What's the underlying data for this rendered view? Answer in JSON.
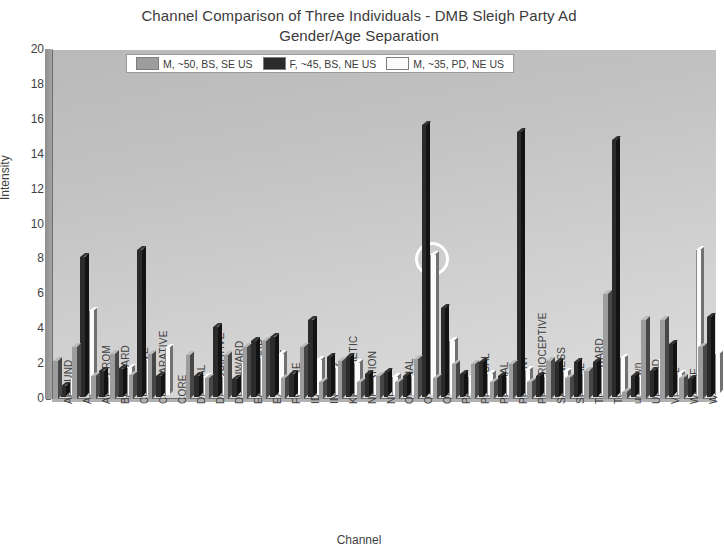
{
  "chart": {
    "title_line1": "Channel Comparison of Three Individuals - DMB Sleigh Party Ad",
    "title_line2": "Gender/Age Separation",
    "xlabel": "Channel",
    "ylabel": "Intensity"
  },
  "legend": {
    "items": [
      {
        "label": "M, ~50, BS, SE US",
        "color": "#9d9d9d"
      },
      {
        "label": "F, ~45, BS, NE US",
        "color": "#2b2b2b"
      },
      {
        "label": "M, ~35, PD, NE US",
        "color": "#fbfbfb"
      }
    ]
  },
  "yaxis": {
    "ticks": [
      "0",
      "2",
      "4",
      "6",
      "8",
      "10",
      "12",
      "14",
      "16",
      "18",
      "20"
    ]
  },
  "annotation": {
    "name": "highlight-circle",
    "target_channel": "OTHERNESS",
    "target_series": "M, ~35, PD, NE US",
    "color": "#ffffff"
  },
  "chart_data": {
    "type": "bar",
    "title": "Channel Comparison of Three Individuals - DMB Sleigh Party Ad Gender/Age Separation",
    "xlabel": "Channel",
    "ylabel": "Intensity",
    "ylim": [
      0,
      20
    ],
    "yticks": [
      0,
      2,
      4,
      6,
      8,
      10,
      12,
      14,
      16,
      18,
      20
    ],
    "grid": false,
    "legend_position": "top-center",
    "style": "3d-grouped-bars",
    "categories": [
      "AROUND",
      "ASSOCIATIVE",
      "AWAYFROM",
      "BACKWARD",
      "COGNITIVE",
      "COMPARATIVE",
      "CORE",
      "DIGITAL",
      "DISSOCIATIVE",
      "DOWNWARD",
      "EARTHWARD",
      "EXTERNAL",
      "FUTURE",
      "IDENTITY",
      "INWARD",
      "KENISTHETIC",
      "NEGATION",
      "NOW",
      "ORDINAL",
      "OTHERNESS",
      "OUTWARD",
      "PAST",
      "PHYSICAL",
      "PLACIAL",
      "PRESENT",
      "PROPRIOCEPTIVE",
      "SAMENESS",
      "SPATIAL",
      "THEREWARD",
      "TOWARD",
      "unknown",
      "UPWARD",
      "VISUAL",
      "WASTE",
      "WITHIN"
    ],
    "series": [
      {
        "name": "M, ~50, BS, SE US",
        "color": "#9d9d9d",
        "values": [
          2.2,
          3.0,
          1.3,
          2.6,
          1.4,
          2.6,
          0,
          2.5,
          1.2,
          2.5,
          3.0,
          3.3,
          1.2,
          3.0,
          1.0,
          2.2,
          1.0,
          1.3,
          1.0,
          2.3,
          1.2,
          2.0,
          2.0,
          1.0,
          2.0,
          1.0,
          2.2,
          1.2,
          1.6,
          6.0,
          0.4,
          4.5,
          4.5,
          1.2,
          3.0
        ]
      },
      {
        "name": "F, ~45, BS, NE US",
        "color": "#2b2b2b",
        "values": [
          0.6,
          8.0,
          1.5,
          1.6,
          8.4,
          1.2,
          0,
          1.2,
          4.0,
          1.0,
          3.2,
          3.4,
          1.3,
          4.4,
          2.3,
          2.3,
          1.3,
          1.4,
          1.2,
          15.6,
          5.1,
          1.3,
          2.0,
          1.2,
          15.2,
          1.2,
          2.0,
          2.0,
          2.0,
          14.7,
          1.2,
          1.5,
          3.0,
          1.0,
          4.6
        ]
      },
      {
        "name": "M, ~35, PD, NE US",
        "color": "#fbfbfb",
        "values": [
          0.9,
          4.8,
          1.0,
          1.5,
          2.0,
          2.7,
          0,
          1.0,
          1.0,
          1.8,
          2.1,
          2.3,
          1.1,
          2.0,
          1.5,
          1.8,
          0.9,
          1.0,
          1.0,
          8.0,
          3.1,
          1.0,
          1.2,
          1.0,
          1.4,
          1.0,
          1.3,
          1.2,
          1.5,
          2.1,
          1.0,
          2.0,
          1.2,
          8.3,
          2.3
        ]
      }
    ],
    "annotations": [
      {
        "type": "circle",
        "category": "OTHERNESS",
        "series": "M, ~35, PD, NE US",
        "value": 8.0,
        "color": "#ffffff"
      }
    ]
  }
}
